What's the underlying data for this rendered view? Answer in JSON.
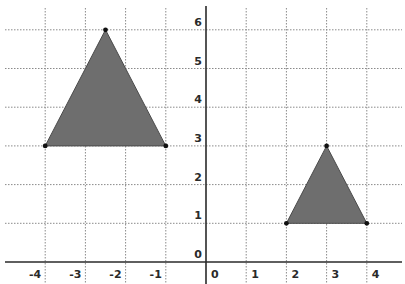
{
  "chart_data": {
    "type": "scatter",
    "title": "",
    "xlabel": "",
    "ylabel": "",
    "xlim": [
      -4,
      4
    ],
    "ylim": [
      0,
      6
    ],
    "grid": true,
    "x_ticks": [
      "-4",
      "-3",
      "-2",
      "-1",
      "0",
      "1",
      "2",
      "3",
      "4"
    ],
    "y_ticks": [
      "0",
      "1",
      "2",
      "3",
      "4",
      "5",
      "6"
    ],
    "shapes": [
      {
        "name": "Triangle A",
        "vertices": [
          [
            -4,
            3
          ],
          [
            -2.5,
            6
          ],
          [
            -1,
            3
          ]
        ],
        "fill": "#6e6e6e"
      },
      {
        "name": "Triangle B",
        "vertices": [
          [
            2,
            1
          ],
          [
            3,
            3
          ],
          [
            4,
            1
          ]
        ],
        "fill": "#6e6e6e"
      }
    ]
  },
  "colors": {
    "fill": "#6e6e6e",
    "edge": "#4a4a4a",
    "grid": "#8a8a8a",
    "axis": "#2a2a2a",
    "point": "#111111"
  }
}
